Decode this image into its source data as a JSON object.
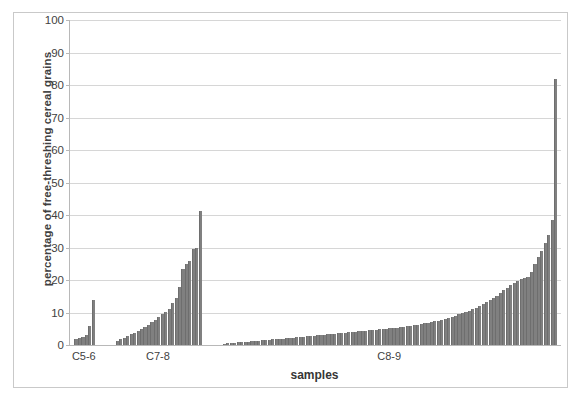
{
  "chart_data": {
    "type": "bar",
    "title": "",
    "xlabel": "samples",
    "ylabel": "percentage of free-threshing cereal grains",
    "ylim": [
      0,
      100
    ],
    "ytick_labels": [
      "100",
      "90",
      "80",
      "70",
      "60",
      "50",
      "40",
      "30",
      "20",
      "10",
      "0"
    ],
    "yticks": [
      100,
      90,
      80,
      70,
      60,
      50,
      40,
      30,
      20,
      10,
      0
    ],
    "grid": true,
    "legend": "none",
    "bar_color": "#808080",
    "groups": [
      {
        "label": "C5-6",
        "values": [
          1.8,
          2.3,
          2.6,
          3.2,
          6.0,
          13.9
        ]
      },
      {
        "label": "C7-8",
        "values": [
          1.2,
          1.8,
          2.3,
          2.8,
          3.3,
          3.8,
          4.4,
          5.0,
          5.6,
          6.2,
          7.0,
          7.6,
          8.5,
          9.4,
          10.2,
          11.0,
          13.0,
          14.5,
          18.0,
          23.5,
          25.0,
          26.0,
          29.5,
          30.0,
          41.2
        ]
      },
      {
        "label": "C8-9",
        "values": [
          0.4,
          0.5,
          0.6,
          0.7,
          0.8,
          0.9,
          1.0,
          1.0,
          1.1,
          1.2,
          1.3,
          1.4,
          1.5,
          1.6,
          1.7,
          1.8,
          1.9,
          2.0,
          2.1,
          2.2,
          2.3,
          2.4,
          2.5,
          2.6,
          2.7,
          2.8,
          2.9,
          3.0,
          3.1,
          3.2,
          3.3,
          3.4,
          3.5,
          3.6,
          3.7,
          3.8,
          3.9,
          4.0,
          4.1,
          4.2,
          4.3,
          4.4,
          4.5,
          4.6,
          4.7,
          4.8,
          4.9,
          5.0,
          5.1,
          5.2,
          5.3,
          5.4,
          5.5,
          5.7,
          5.9,
          6.1,
          6.3,
          6.5,
          6.7,
          6.9,
          7.1,
          7.3,
          7.5,
          7.8,
          8.1,
          8.4,
          8.7,
          9.0,
          9.4,
          9.8,
          10.2,
          10.6,
          11.0,
          11.5,
          12.0,
          12.6,
          13.2,
          13.8,
          14.5,
          15.2,
          16.0,
          16.8,
          17.6,
          18.4,
          19.2,
          19.8,
          20.2,
          20.6,
          21.0,
          22.5,
          25.0,
          27.0,
          29.0,
          31.5,
          34.0,
          38.5,
          82.0
        ]
      }
    ]
  }
}
